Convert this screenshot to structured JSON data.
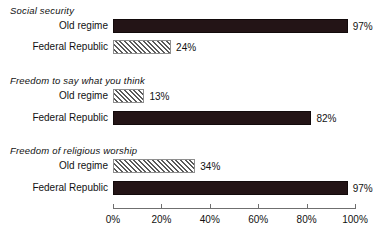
{
  "chart_data": {
    "type": "bar",
    "orientation": "horizontal",
    "title": "",
    "xlabel": "",
    "ylabel": "",
    "xlim": [
      0,
      100
    ],
    "grid": false,
    "legend_position": "none",
    "axis": {
      "ticks": [
        0,
        20,
        40,
        60,
        80,
        100
      ],
      "tick_labels": [
        "0%",
        "20%",
        "40%",
        "60%",
        "80%",
        "100%"
      ],
      "unit": "%"
    },
    "series": [
      {
        "name": "Old regime",
        "style": "hatched"
      },
      {
        "name": "Federal Republic",
        "style": "solid"
      }
    ],
    "groups": [
      {
        "title": "Social security",
        "bars": [
          {
            "label": "Old regime",
            "value": 97,
            "value_label": "97%",
            "style": "solid"
          },
          {
            "label": "Federal Republic",
            "value": 24,
            "value_label": "24%",
            "style": "hatched"
          }
        ]
      },
      {
        "title": "Freedom to say what you think",
        "bars": [
          {
            "label": "Old regime",
            "value": 13,
            "value_label": "13%",
            "style": "hatched"
          },
          {
            "label": "Federal Republic",
            "value": 82,
            "value_label": "82%",
            "style": "solid"
          }
        ]
      },
      {
        "title": "Freedom of religious worship",
        "bars": [
          {
            "label": "Old regime",
            "value": 34,
            "value_label": "34%",
            "style": "hatched"
          },
          {
            "label": "Federal Republic",
            "value": 97,
            "value_label": "97%",
            "style": "solid"
          }
        ]
      }
    ],
    "colors": {
      "solid_fill": "#231416",
      "hatch_line": "#5a5a5a",
      "hatch_background": "#ffffff",
      "hatch_border": "#8e8e8e",
      "axis": "#6f6f6f",
      "text": "#111111",
      "background": "#ffffff"
    }
  },
  "layout": {
    "plot_left_px": 113,
    "plot_width_px": 242,
    "group_title_tops": [
      5,
      75,
      145
    ],
    "row_tops": [
      [
        18,
        39
      ],
      [
        88,
        110
      ],
      [
        158,
        180
      ]
    ],
    "axis_top_px": 208
  }
}
